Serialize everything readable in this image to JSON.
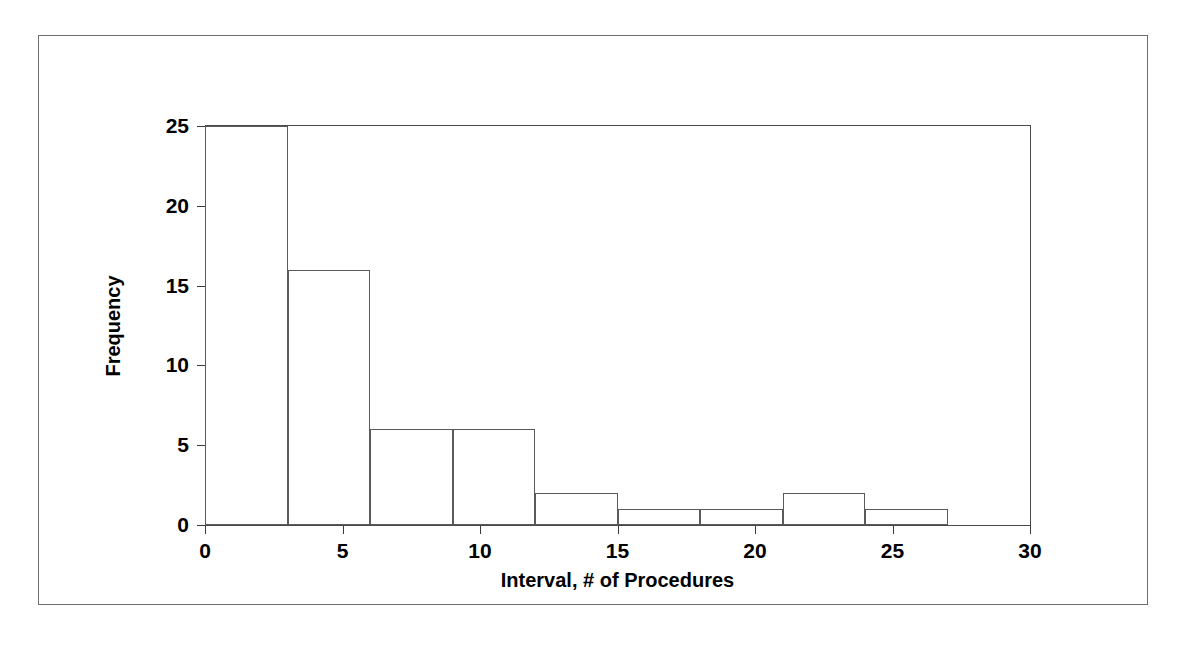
{
  "chart_data": {
    "type": "bar",
    "title": "",
    "subtitle": "",
    "xlabel": "Interval, # of Procedures",
    "ylabel": "Frequency",
    "categories": [
      "0-3",
      "3-6",
      "6-9",
      "9-12",
      "12-15",
      "15-18",
      "18-21",
      "21-24",
      "24-27",
      "27-30"
    ],
    "bin_edges": [
      0,
      3,
      6,
      9,
      12,
      15,
      18,
      21,
      24,
      27,
      30
    ],
    "bin_width": 3,
    "values": [
      25,
      16,
      6,
      6,
      2,
      1,
      1,
      2,
      1,
      0
    ],
    "xlim": [
      0,
      30
    ],
    "ylim": [
      0,
      25
    ],
    "xticks": [
      0,
      5,
      10,
      15,
      20,
      25,
      30
    ],
    "yticks": [
      0,
      5,
      10,
      15,
      20,
      25
    ],
    "xtick_labels": [
      "0",
      "5",
      "10",
      "15",
      "20",
      "25",
      "30"
    ],
    "ytick_labels": [
      "0",
      "5",
      "10",
      "15",
      "20",
      "25"
    ],
    "grid": false,
    "legend": false,
    "legend_position": "none",
    "bar_fill_color": "#ffffff",
    "bar_edge_color": "#5a5a5a",
    "axis_color": "#4a4a4a",
    "text_color": "#000000",
    "background_color": "#ffffff",
    "frame_border_color": "#6e6e6e"
  },
  "figure": {
    "border_visible": true
  }
}
